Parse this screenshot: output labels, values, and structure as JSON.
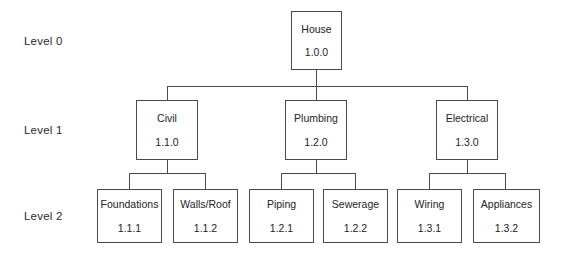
{
  "diagram": {
    "type": "work-breakdown-structure-tree",
    "background_color": "#ffffff",
    "box_fill_color": "#ffffff",
    "box_border_color": "#4a4a4a",
    "box_shadow_color": "#333333",
    "line_color": "#4a4a4a",
    "text_color": "#232323"
  },
  "levels": [
    {
      "label": "Level 0"
    },
    {
      "label": "Level 1"
    },
    {
      "label": "Level 2"
    }
  ],
  "nodes": {
    "root": {
      "title": "House",
      "code": "1.0.0"
    },
    "civil": {
      "title": "Civil",
      "code": "1.1.0"
    },
    "plumbing": {
      "title": "Plumbing",
      "code": "1.2.0"
    },
    "electrical": {
      "title": "Electrical",
      "code": "1.3.0"
    },
    "foundations": {
      "title": "Foundations",
      "code": "1.1.1"
    },
    "walls_roof": {
      "title": "Walls/Roof",
      "code": "1.1.2"
    },
    "piping": {
      "title": "Piping",
      "code": "1.2.1"
    },
    "sewerage": {
      "title": "Sewerage",
      "code": "1.2.2"
    },
    "wiring": {
      "title": "Wiring",
      "code": "1.3.1"
    },
    "appliances": {
      "title": "Appliances",
      "code": "1.3.2"
    }
  }
}
